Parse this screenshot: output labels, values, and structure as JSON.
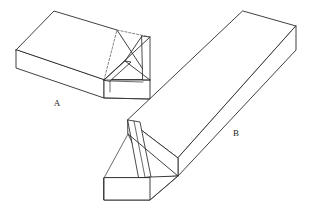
{
  "figure": {
    "background_color": "#ffffff",
    "stroke_color": "#2b2b2b",
    "projection": "oblique-isometric",
    "width": 312,
    "height": 210
  },
  "labels": {
    "part_a": "A",
    "part_b": "B"
  },
  "parts": [
    {
      "id": "part-a",
      "label": "A",
      "description": "Rectangular block with dovetail socket cut in near end",
      "label_x": 57,
      "label_y": 106
    },
    {
      "id": "part-b",
      "label": "B",
      "description": "Long beam with dovetail tail formed on near end",
      "label_x": 236,
      "label_y": 136
    }
  ],
  "geometry": {
    "part_a": {
      "top_face": "16,50 54,11 116,30 149,80",
      "front_face": "16,50 16,68 104,97 104,80",
      "right_end_face": "104,80 104,97 149,99 149,80",
      "socket_opening": "104,80 125,62 140,84 118,96",
      "socket_lines": [
        "104,80 149,80",
        "125,62 149,37",
        "140,84 149,80",
        "118,96 104,97"
      ]
    },
    "part_b": {
      "top_face": "243,11 296,26 178,158 128,120",
      "right_end_face": "296,26 296,50 178,175 178,158",
      "left_long_face": "128,120 178,158 178,175 104,200 104,178",
      "tail_face": "128,120 140,122 150,177 139,178",
      "tail_end": "104,178 139,178 150,177 104,200"
    }
  }
}
